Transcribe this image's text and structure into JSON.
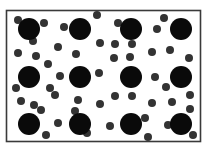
{
  "diagram": {
    "title": "",
    "colors": {
      "background": "#ffffff",
      "border": "#3a3a3a",
      "large_particle": "#0a0a0a",
      "small_particle": "#333333"
    },
    "container": {
      "x": 6.5,
      "y": 10.5,
      "width": 194,
      "height": 131,
      "stroke_width": 1.6
    },
    "large_particles": {
      "radius": 11,
      "items": [
        {
          "x": 29,
          "y": 29
        },
        {
          "x": 80,
          "y": 29
        },
        {
          "x": 131,
          "y": 29
        },
        {
          "x": 181,
          "y": 29
        },
        {
          "x": 29,
          "y": 77
        },
        {
          "x": 80,
          "y": 77
        },
        {
          "x": 131,
          "y": 77
        },
        {
          "x": 181,
          "y": 77
        },
        {
          "x": 29,
          "y": 124
        },
        {
          "x": 80,
          "y": 124
        },
        {
          "x": 131,
          "y": 124
        },
        {
          "x": 181,
          "y": 124
        }
      ]
    },
    "small_particles": {
      "radius": 4,
      "items": [
        {
          "x": 18,
          "y": 20
        },
        {
          "x": 44,
          "y": 23
        },
        {
          "x": 33,
          "y": 41
        },
        {
          "x": 64,
          "y": 27
        },
        {
          "x": 97,
          "y": 15
        },
        {
          "x": 118,
          "y": 23
        },
        {
          "x": 157,
          "y": 29
        },
        {
          "x": 164,
          "y": 18
        },
        {
          "x": 58,
          "y": 47
        },
        {
          "x": 100,
          "y": 43
        },
        {
          "x": 115,
          "y": 44
        },
        {
          "x": 132,
          "y": 44
        },
        {
          "x": 18,
          "y": 53
        },
        {
          "x": 36,
          "y": 56
        },
        {
          "x": 48,
          "y": 64
        },
        {
          "x": 76,
          "y": 54
        },
        {
          "x": 114,
          "y": 58
        },
        {
          "x": 130,
          "y": 57
        },
        {
          "x": 152,
          "y": 52
        },
        {
          "x": 170,
          "y": 50
        },
        {
          "x": 189,
          "y": 58
        },
        {
          "x": 60,
          "y": 76
        },
        {
          "x": 99,
          "y": 73
        },
        {
          "x": 155,
          "y": 77
        },
        {
          "x": 166,
          "y": 87
        },
        {
          "x": 16,
          "y": 88
        },
        {
          "x": 50,
          "y": 88
        },
        {
          "x": 55,
          "y": 95
        },
        {
          "x": 115,
          "y": 96
        },
        {
          "x": 132,
          "y": 96
        },
        {
          "x": 190,
          "y": 95
        },
        {
          "x": 21,
          "y": 101
        },
        {
          "x": 34,
          "y": 105
        },
        {
          "x": 41,
          "y": 110
        },
        {
          "x": 78,
          "y": 100
        },
        {
          "x": 100,
          "y": 104
        },
        {
          "x": 75,
          "y": 111
        },
        {
          "x": 152,
          "y": 103
        },
        {
          "x": 172,
          "y": 102
        },
        {
          "x": 190,
          "y": 109
        },
        {
          "x": 58,
          "y": 123
        },
        {
          "x": 110,
          "y": 126
        },
        {
          "x": 145,
          "y": 118
        },
        {
          "x": 168,
          "y": 125
        },
        {
          "x": 46,
          "y": 135
        },
        {
          "x": 87,
          "y": 133
        },
        {
          "x": 148,
          "y": 137
        },
        {
          "x": 193,
          "y": 135
        }
      ]
    }
  }
}
